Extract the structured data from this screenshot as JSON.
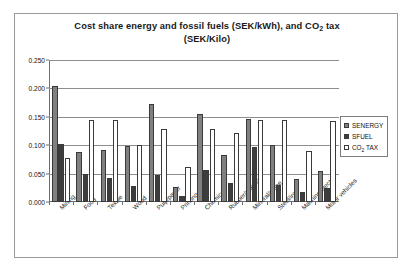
{
  "chart_data": {
    "type": "bar",
    "title": "Cost share energy and fossil fuels (SEK/kWh), and CO2 tax (SEK/Kilo)",
    "title_line1": "Cost share energy and fossil fuels (SEK/kWh), and CO",
    "title_line1_sub": "2",
    "title_line1_tail": " tax",
    "title_line2": "(SEK/Kilo)",
    "xlabel": "",
    "ylabel": "",
    "ylim": [
      0.0,
      0.25
    ],
    "ytick_labels": [
      "0.000",
      "0.050",
      "0.100",
      "0.150",
      "0.200",
      "0.250"
    ],
    "ytick_values": [
      0.0,
      0.05,
      0.1,
      0.15,
      0.2,
      0.25
    ],
    "grid": true,
    "legend_position": "right",
    "categories": [
      "Mining",
      "Food",
      "Textile",
      "Wood",
      "Pulp/paper",
      "Printing",
      "Chemical",
      "Rubber/plastic",
      "Mineral/stone",
      "Steel/iron",
      "Machine/electro",
      "Motor vehicles"
    ],
    "series": [
      {
        "name": "SENERGY",
        "color": "#808080",
        "values": [
          0.205,
          0.088,
          0.092,
          0.098,
          0.172,
          0.027,
          0.155,
          0.082,
          0.147,
          0.1,
          0.04,
          0.055
        ]
      },
      {
        "name": "SFUEL",
        "color": "#3d3d3d",
        "values": [
          0.103,
          0.05,
          0.043,
          0.028,
          0.047,
          0.01,
          0.057,
          0.033,
          0.097,
          0.03,
          0.018,
          0.025
        ]
      },
      {
        "name": "CO2 TAX",
        "color": "#ffffff",
        "values": [
          0.077,
          0.145,
          0.145,
          0.1,
          0.128,
          0.062,
          0.128,
          0.122,
          0.145,
          0.145,
          0.09,
          0.143
        ]
      }
    ],
    "legend": [
      {
        "label": "SENERGY",
        "label_pre": "SENERGY",
        "label_sub": "",
        "label_post": "",
        "color": "#808080"
      },
      {
        "label": "SFUEL",
        "label_pre": "SFUEL",
        "label_sub": "",
        "label_post": "",
        "color": "#3d3d3d"
      },
      {
        "label": "CO2 TAX",
        "label_pre": "CO",
        "label_sub": "2",
        "label_post": " TAX",
        "color": "#ffffff"
      }
    ]
  }
}
